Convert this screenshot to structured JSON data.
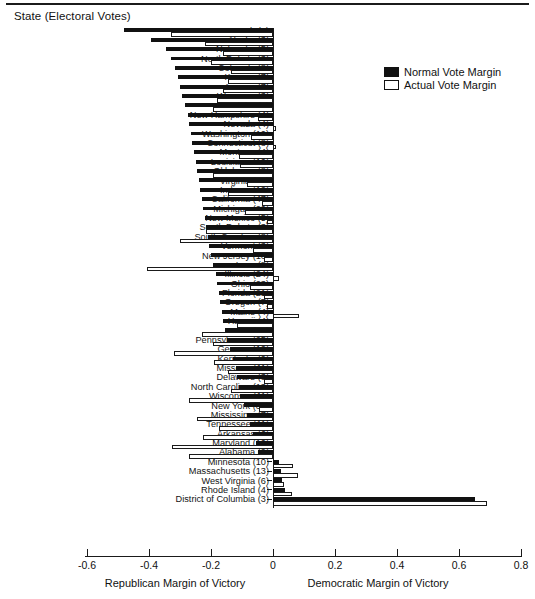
{
  "header": {
    "y_axis_title": "State (Electoral Votes)"
  },
  "legend": {
    "position": "top-right",
    "items": [
      {
        "label": "Normal Vote Margin",
        "color": "#111111",
        "swatch": "filled"
      },
      {
        "label": "Actual Vote Margin",
        "color": "#ffffff",
        "swatch": "outline"
      }
    ]
  },
  "footer": {
    "left_label": "Republican Margin of Victory",
    "right_label": "Democratic Margin of Victory"
  },
  "chart_data": {
    "type": "bar",
    "orientation": "horizontal",
    "title": "",
    "xlabel": "Margin of Victory",
    "ylabel": "State (Electoral Votes)",
    "xlim": [
      -0.6,
      0.8
    ],
    "xticks": [
      -0.6,
      -0.4,
      -0.2,
      0,
      0.2,
      0.4,
      0.6,
      0.8
    ],
    "xticklabels": [
      "-0.6",
      "-0.4",
      "-0.2",
      "0",
      "0.2",
      "0.4",
      "0.6",
      "0.8"
    ],
    "grid": false,
    "legend_position": "top right",
    "series": [
      {
        "name": "Normal Vote Margin",
        "key": "normal",
        "color": "#111111"
      },
      {
        "name": "Actual Vote Margin",
        "key": "actual",
        "color": "#ffffff"
      }
    ],
    "categories": [
      "Utah (5)",
      "Alaska (3)",
      "Nebraska (5)",
      "North Dakota (3)",
      "Colorado (8)",
      "Kansas (7)",
      "Arizona (7)",
      "Wyoming (3)",
      "Idaho (4)",
      "New Hampshire (4)",
      "Nevada (4)",
      "Washington (10)",
      "Connecticut (8)",
      "Montana (4)",
      "Louisiana (10)",
      "Oklahoma (8)",
      "Virginia (12)",
      "Indiana (12)",
      "California (47)",
      "Michigan (20)",
      "New Mexico (5)",
      "South Dakota (3)",
      "South Carolina (8)",
      "Vermont (3)",
      "New Jersey (16)",
      "Iowa (8)",
      "Illinois (24)",
      "Ohio (23)",
      "Florida (21)",
      "Oregon (7)",
      "Maine (4)",
      "Hawaii (4)",
      "Texas (29)",
      "Pennsylvania (25)",
      "Georgia (12)",
      "Kentucky (9)",
      "Missouri (11)",
      "Delaware (3)",
      "North Carolina (13)",
      "Wisconsin (11)",
      "New York (36)",
      "Mississippi (7)",
      "Tennessee (11)",
      "Arkansas (6)",
      "Maryland (10)",
      "Alabama (9)",
      "Minnesota (10)",
      "Massachusetts (13)",
      "West Virginia (6)",
      "Rhode Island (4)",
      "District of Columbia (3)"
    ],
    "highlighted_categories": [
      "New Hampshire (4)",
      "Maryland (10)"
    ],
    "values": {
      "normal": [
        -0.48,
        -0.395,
        -0.345,
        -0.33,
        -0.315,
        -0.305,
        -0.3,
        -0.295,
        -0.285,
        -0.275,
        -0.27,
        -0.265,
        -0.26,
        -0.255,
        -0.25,
        -0.245,
        -0.24,
        -0.235,
        -0.23,
        -0.225,
        -0.22,
        -0.215,
        -0.21,
        -0.205,
        -0.2,
        -0.195,
        -0.185,
        -0.18,
        -0.175,
        -0.17,
        -0.165,
        -0.16,
        -0.155,
        -0.15,
        -0.14,
        -0.13,
        -0.12,
        -0.115,
        -0.11,
        -0.105,
        -0.095,
        -0.085,
        -0.075,
        -0.065,
        -0.055,
        -0.05,
        0.02,
        0.025,
        0.03,
        0.04,
        0.65
      ],
      "actual": [
        -0.33,
        -0.22,
        -0.16,
        -0.2,
        -0.135,
        -0.145,
        -0.16,
        -0.18,
        -0.195,
        -0.05,
        0.01,
        -0.07,
        0.01,
        -0.11,
        -0.105,
        -0.195,
        -0.085,
        -0.145,
        -0.035,
        -0.09,
        -0.02,
        -0.215,
        -0.3,
        -0.065,
        -0.03,
        -0.405,
        0.02,
        -0.075,
        -0.03,
        -0.02,
        0.085,
        -0.115,
        -0.23,
        -0.195,
        -0.32,
        -0.19,
        -0.145,
        -0.03,
        -0.135,
        -0.27,
        -0.045,
        -0.245,
        -0.175,
        -0.225,
        -0.325,
        -0.27,
        0.065,
        0.08,
        0.035,
        0.06,
        0.69
      ]
    }
  }
}
